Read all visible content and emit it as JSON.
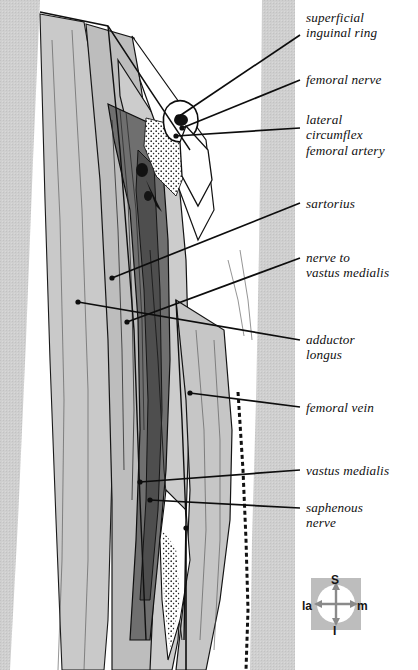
{
  "figure": {
    "background_color": "#ffffff",
    "ink_color": "#111111",
    "tones": {
      "skin_texture": "#cfcfcf",
      "muscle_light": "#c8c8c8",
      "muscle_mid": "#b0b0b0",
      "vessel_dark": "#6e6e6e",
      "vessel_darkest": "#4a4a4a",
      "paper": "#ffffff"
    }
  },
  "labels": [
    {
      "id": "superficial-inguinal-ring",
      "text": "superficial\ninguinal ring",
      "x": 306,
      "y": 10,
      "leader": {
        "x1": 300,
        "y1": 35,
        "x2": 178,
        "y2": 117
      }
    },
    {
      "id": "femoral-nerve",
      "text": "femoral nerve",
      "x": 306,
      "y": 72,
      "leader": {
        "x1": 300,
        "y1": 80,
        "x2": 182,
        "y2": 128
      }
    },
    {
      "id": "lateral-circumflex-femoral-artery",
      "text": "lateral\ncircumflex\nfemoral artery",
      "x": 306,
      "y": 112,
      "leader": {
        "x1": 300,
        "y1": 128,
        "x2": 176,
        "y2": 136
      }
    },
    {
      "id": "sartorius",
      "text": "sartorius",
      "x": 306,
      "y": 196,
      "leader": {
        "x1": 300,
        "y1": 203,
        "x2": 112,
        "y2": 278
      }
    },
    {
      "id": "nerve-to-vastus-medialis",
      "text": "nerve to\nvastus medialis",
      "x": 306,
      "y": 250,
      "leader": {
        "x1": 300,
        "y1": 258,
        "x2": 127,
        "y2": 322
      }
    },
    {
      "id": "adductor-longus",
      "text": "adductor\nlongus",
      "x": 306,
      "y": 332,
      "leader": {
        "x1": 300,
        "y1": 340,
        "x2": 78,
        "y2": 302
      }
    },
    {
      "id": "femoral-vein",
      "text": "femoral vein",
      "x": 306,
      "y": 400,
      "leader": {
        "x1": 300,
        "y1": 407,
        "x2": 190,
        "y2": 393
      }
    },
    {
      "id": "vastus-medialis",
      "text": "vastus medialis",
      "x": 306,
      "y": 463,
      "leader": {
        "x1": 300,
        "y1": 470,
        "x2": 140,
        "y2": 482
      }
    },
    {
      "id": "saphenous-nerve",
      "text": "saphenous\nnerve",
      "x": 306,
      "y": 500,
      "leader": {
        "x1": 300,
        "y1": 508,
        "x2": 150,
        "y2": 500
      }
    }
  ],
  "compass": {
    "superior": "S",
    "inferior": "I",
    "lateral": "la",
    "medial": "m",
    "box_color": "#b9b9b9",
    "disc_color": "#ffffff",
    "arrow_color": "#8a8a8a"
  }
}
